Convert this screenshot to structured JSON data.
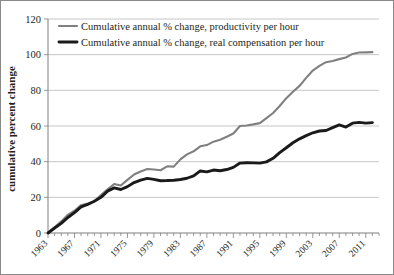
{
  "chart_data": {
    "type": "line",
    "title": "",
    "xlabel": "",
    "ylabel": "cumulative percent change",
    "ylim": [
      0,
      120
    ],
    "yticks": [
      0,
      20,
      40,
      60,
      80,
      100,
      120
    ],
    "xlim": [
      1963,
      2013
    ],
    "xticks": [
      1963,
      1967,
      1971,
      1975,
      1979,
      1983,
      1987,
      1991,
      1995,
      1999,
      2003,
      2007,
      2011
    ],
    "grid": true,
    "legend_position": "top-left",
    "x": [
      1963,
      1964,
      1965,
      1966,
      1967,
      1968,
      1969,
      1970,
      1971,
      1972,
      1973,
      1974,
      1975,
      1976,
      1977,
      1978,
      1979,
      1980,
      1981,
      1982,
      1983,
      1984,
      1985,
      1986,
      1987,
      1988,
      1989,
      1990,
      1991,
      1992,
      1993,
      1994,
      1995,
      1996,
      1997,
      1998,
      1999,
      2000,
      2001,
      2002,
      2003,
      2004,
      2005,
      2006,
      2007,
      2008,
      2009,
      2010,
      2011,
      2012
    ],
    "series": [
      {
        "name": "Cumulative annual % change, productivity per hour",
        "color": "#808080",
        "values": [
          0.0,
          3.2,
          6.5,
          10.2,
          12.5,
          15.6,
          16.6,
          17.8,
          21.3,
          24.5,
          27.5,
          26.6,
          29.8,
          32.8,
          34.5,
          35.9,
          35.6,
          35.2,
          37.4,
          37.2,
          41.3,
          44.1,
          45.8,
          48.6,
          49.3,
          51.2,
          52.3,
          54.0,
          55.8,
          60.0,
          60.3,
          60.9,
          61.6,
          64.4,
          67.3,
          71.2,
          75.6,
          79.2,
          82.5,
          87.0,
          91.1,
          93.7,
          95.8,
          96.5,
          97.5,
          98.4,
          100.4,
          101.2,
          101.3,
          101.4
        ]
      },
      {
        "name": "Cumulative annual % change, real compensation per hour",
        "color": "#1a1a1a",
        "values": [
          0.0,
          2.8,
          5.4,
          8.7,
          11.4,
          14.6,
          16.0,
          17.8,
          20.0,
          23.5,
          25.3,
          24.4,
          26.0,
          28.3,
          29.6,
          30.6,
          30.1,
          29.3,
          29.4,
          29.6,
          30.0,
          30.7,
          32.0,
          34.8,
          34.3,
          35.3,
          34.9,
          35.6,
          36.8,
          39.2,
          39.4,
          39.3,
          39.2,
          39.9,
          41.9,
          45.1,
          47.8,
          50.6,
          52.8,
          54.6,
          56.2,
          57.2,
          57.5,
          59.1,
          60.6,
          59.4,
          61.6,
          62.0,
          61.6,
          61.9
        ]
      }
    ]
  },
  "legend": {
    "entries": [
      {
        "label": "Cumulative annual % change, productivity per hour",
        "color": "#808080",
        "swatch": "line-swatch-gray"
      },
      {
        "label": "Cumulative annual % change, real compensation per hour",
        "color": "#1a1a1a",
        "swatch": "line-swatch-black"
      }
    ]
  }
}
